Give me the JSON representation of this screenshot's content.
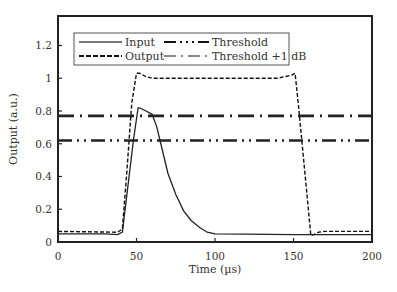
{
  "chart_data": {
    "type": "line",
    "title": "",
    "xlabel": "Time (µs)",
    "ylabel": "Output (a.u.)",
    "xlim": [
      0,
      200
    ],
    "ylim": [
      0,
      1.38
    ],
    "xticks": [
      0,
      50,
      100,
      150,
      200
    ],
    "xtick_labels": [
      "0",
      "50",
      "100",
      "150",
      "200"
    ],
    "yticks": [
      0,
      0.2,
      0.4,
      0.6,
      0.8,
      1,
      1.2
    ],
    "ytick_labels": [
      "0",
      "0.2",
      "0.4",
      "0.6",
      "0.8",
      "1",
      "1.2"
    ],
    "grid": false,
    "legend_position": "upper center (inside)",
    "series": [
      {
        "name": "Input",
        "style": "solid",
        "color": "#222222",
        "x": [
          0,
          30,
          38,
          41,
          44,
          48,
          51,
          53,
          56,
          60,
          63,
          66,
          70,
          75,
          80,
          85,
          90,
          95,
          100,
          120,
          150,
          200
        ],
        "y": [
          0.05,
          0.05,
          0.045,
          0.06,
          0.3,
          0.62,
          0.82,
          0.815,
          0.8,
          0.78,
          0.7,
          0.58,
          0.42,
          0.29,
          0.19,
          0.13,
          0.09,
          0.06,
          0.05,
          0.048,
          0.045,
          0.045
        ]
      },
      {
        "name": "Output",
        "style": "dashed",
        "color": "#111111",
        "x": [
          0,
          38,
          41,
          44,
          47,
          50,
          52,
          56,
          60,
          100,
          140,
          149,
          151,
          153,
          156,
          159,
          161,
          163,
          166,
          170,
          200
        ],
        "y": [
          0.065,
          0.06,
          0.08,
          0.45,
          0.85,
          1.03,
          1.03,
          1.01,
          1.0,
          1.0,
          1.0,
          1.02,
          1.03,
          0.85,
          0.55,
          0.25,
          0.04,
          0.045,
          0.06,
          0.065,
          0.065
        ]
      },
      {
        "name": "Threshold",
        "style": "dash-dot-dot",
        "color": "#222222",
        "x": [
          0,
          200
        ],
        "y": [
          0.62,
          0.62
        ]
      },
      {
        "name": "Threshold +1 dB",
        "style": "dash-dot",
        "color": "#222222",
        "x": [
          0,
          200
        ],
        "y": [
          0.77,
          0.77
        ]
      }
    ]
  },
  "legend": {
    "items": [
      {
        "label": "Input",
        "style": "solid"
      },
      {
        "label": "Output",
        "style": "dashed"
      },
      {
        "label": "Threshold",
        "style": "dash-dot-dot"
      },
      {
        "label": "Threshold +1 dB",
        "style": "dash-dot"
      }
    ]
  }
}
